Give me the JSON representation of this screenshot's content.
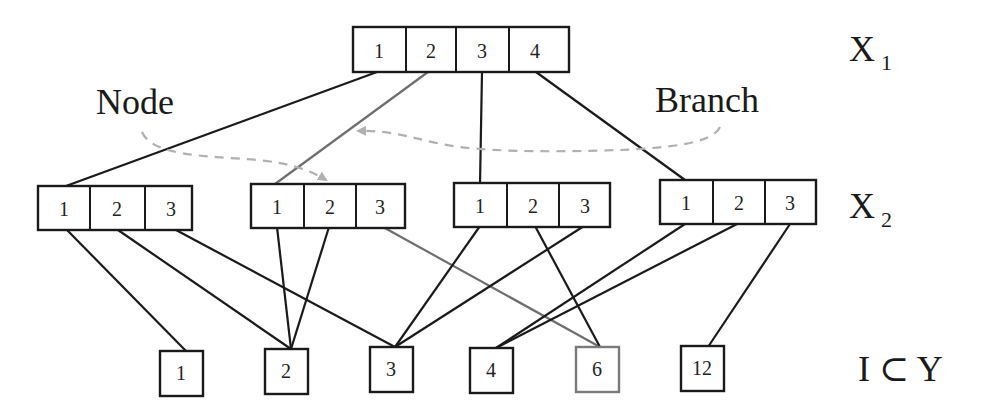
{
  "labels": {
    "node": "Node",
    "branch": "Branch",
    "x1": "X",
    "x1_sub": "1",
    "x2": "X",
    "x2_sub": "2",
    "leaf_row": "I ⊂ Y"
  },
  "colors": {
    "line": "#1a1a1a",
    "highlight_line": "#6e6e6e",
    "dashed_arrow": "#b0b0b0",
    "box_border": "#1a1a1a",
    "highlight_box_border": "#7a7a7a"
  },
  "top_node": {
    "cells": [
      "1",
      "2",
      "3",
      "4"
    ]
  },
  "second_level": [
    {
      "cells": [
        "1",
        "2",
        "3"
      ]
    },
    {
      "cells": [
        "1",
        "2",
        "3"
      ]
    },
    {
      "cells": [
        "1",
        "2",
        "3"
      ]
    },
    {
      "cells": [
        "1",
        "2",
        "3"
      ]
    }
  ],
  "leaves": [
    "1",
    "2",
    "3",
    "4",
    "6",
    "12"
  ],
  "edges_top_to_second": [
    {
      "from_cell": "1",
      "to_group": 1
    },
    {
      "from_cell": "2",
      "to_group": 2,
      "highlight": true
    },
    {
      "from_cell": "3",
      "to_group": 3
    },
    {
      "from_cell": "4",
      "to_group": 4
    }
  ],
  "edges_second_to_leaves": [
    {
      "group": 1,
      "cell": "1",
      "leaf": "1"
    },
    {
      "group": 1,
      "cell": "2",
      "leaf": "2"
    },
    {
      "group": 1,
      "cell": "3",
      "leaf": "3"
    },
    {
      "group": 2,
      "cell": "1",
      "leaf": "2"
    },
    {
      "group": 2,
      "cell": "2",
      "leaf": "2"
    },
    {
      "group": 2,
      "cell": "3",
      "leaf": "6",
      "highlight": true
    },
    {
      "group": 3,
      "cell": "1",
      "leaf": "3"
    },
    {
      "group": 3,
      "cell": "2",
      "leaf": "6"
    },
    {
      "group": 3,
      "cell": "3",
      "leaf": "3"
    },
    {
      "group": 4,
      "cell": "1",
      "leaf": "4"
    },
    {
      "group": 4,
      "cell": "2",
      "leaf": "4"
    },
    {
      "group": 4,
      "cell": "3",
      "leaf": "12"
    }
  ],
  "annotations": [
    {
      "label": "Node",
      "arrow": "dashed, points to group 2 cell 2"
    },
    {
      "label": "Branch",
      "arrow": "dashed, points to edge from top cell 2"
    }
  ]
}
